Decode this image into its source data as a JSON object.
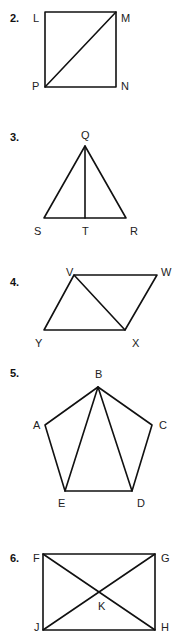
{
  "figures": [
    {
      "number": "2.",
      "shape": "square",
      "vertices": {
        "L": [
          45,
          12
        ],
        "M": [
          116,
          12
        ],
        "N": [
          116,
          87
        ],
        "P": [
          45,
          87
        ]
      },
      "segments": [
        [
          "L",
          "M"
        ],
        [
          "M",
          "N"
        ],
        [
          "N",
          "P"
        ],
        [
          "P",
          "L"
        ],
        [
          "P",
          "M"
        ]
      ],
      "labels": {
        "L": "L",
        "M": "M",
        "N": "N",
        "P": "P"
      }
    },
    {
      "number": "3.",
      "shape": "triangle",
      "vertices": {
        "Q": [
          85,
          146
        ],
        "S": [
          44,
          218
        ],
        "T": [
          85,
          218
        ],
        "R": [
          126,
          218
        ]
      },
      "segments": [
        [
          "Q",
          "S"
        ],
        [
          "Q",
          "R"
        ],
        [
          "S",
          "R"
        ],
        [
          "Q",
          "T"
        ]
      ],
      "labels": {
        "Q": "Q",
        "S": "S",
        "T": "T",
        "R": "R"
      }
    },
    {
      "number": "4.",
      "shape": "parallelogram",
      "vertices": {
        "V": [
          74,
          275
        ],
        "W": [
          157,
          275
        ],
        "X": [
          125,
          330
        ],
        "Y": [
          44,
          330
        ]
      },
      "segments": [
        [
          "V",
          "W"
        ],
        [
          "W",
          "X"
        ],
        [
          "X",
          "Y"
        ],
        [
          "Y",
          "V"
        ],
        [
          "V",
          "X"
        ]
      ],
      "labels": {
        "V": "V",
        "W": "W",
        "X": "X",
        "Y": "Y"
      }
    },
    {
      "number": "5.",
      "shape": "pentagon",
      "vertices": {
        "A": [
          45,
          425
        ],
        "B": [
          98,
          387
        ],
        "C": [
          152,
          425
        ],
        "D": [
          132,
          491
        ],
        "E": [
          65,
          491
        ]
      },
      "segments": [
        [
          "A",
          "B"
        ],
        [
          "B",
          "C"
        ],
        [
          "C",
          "D"
        ],
        [
          "D",
          "E"
        ],
        [
          "E",
          "A"
        ],
        [
          "B",
          "E"
        ],
        [
          "B",
          "D"
        ]
      ],
      "labels": {
        "A": "A",
        "B": "B",
        "C": "C",
        "D": "D",
        "E": "E"
      }
    },
    {
      "number": "6.",
      "shape": "rectangle",
      "vertices": {
        "F": [
          43,
          554
        ],
        "G": [
          155,
          554
        ],
        "H": [
          155,
          630
        ],
        "J": [
          43,
          630
        ],
        "K": [
          99,
          592
        ]
      },
      "segments": [
        [
          "F",
          "G"
        ],
        [
          "G",
          "H"
        ],
        [
          "H",
          "J"
        ],
        [
          "J",
          "F"
        ],
        [
          "F",
          "H"
        ],
        [
          "G",
          "J"
        ]
      ],
      "labels": {
        "F": "F",
        "G": "G",
        "H": "H",
        "J": "J",
        "K": "K"
      }
    }
  ]
}
